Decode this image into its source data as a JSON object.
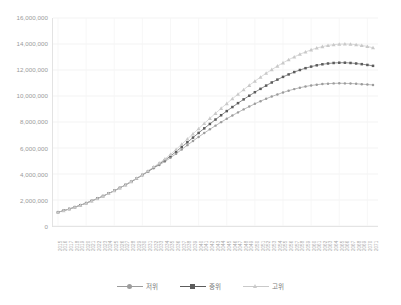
{
  "chart_data": {
    "type": "line",
    "title": "",
    "subtitle": "",
    "xlabel": "",
    "ylabel": "",
    "grid": true,
    "legend_position": "bottom",
    "ylim": [
      0,
      16000000
    ],
    "y_ticks": [
      0,
      2000000,
      4000000,
      6000000,
      8000000,
      10000000,
      12000000,
      14000000,
      16000000
    ],
    "y_tick_labels": [
      "0",
      "2,000,000",
      "4,000,000",
      "6,000,000",
      "8,000,000",
      "10,000,000",
      "12,000,000",
      "14,000,000",
      "16,000,000"
    ],
    "categories": [
      "2015",
      "2016",
      "2017",
      "2018",
      "2019",
      "2020",
      "2021",
      "2022",
      "2023",
      "2024",
      "2025",
      "2026",
      "2027",
      "2028",
      "2029",
      "2030",
      "2031",
      "2032",
      "2033",
      "2034",
      "2035",
      "2036",
      "2037",
      "2038",
      "2039",
      "2040",
      "2041",
      "2042",
      "2043",
      "2044",
      "2045",
      "2046",
      "2047",
      "2048",
      "2049",
      "2050",
      "2051",
      "2052",
      "2053",
      "2054",
      "2055",
      "2056",
      "2057",
      "2058",
      "2059",
      "2060",
      "2061",
      "2062",
      "2063",
      "2064",
      "2065",
      "2066",
      "2067",
      "2068",
      "2069",
      "2070",
      "2071"
    ],
    "series": [
      {
        "name": "저위",
        "color": "#9c9c9c",
        "marker": "circle",
        "values": [
          1060000,
          1180000,
          1310000,
          1450000,
          1600000,
          1760000,
          1930000,
          2110000,
          2300000,
          2500000,
          2710000,
          2930000,
          3160000,
          3400000,
          3650000,
          3910000,
          4180000,
          4450000,
          4700000,
          4960000,
          5250000,
          5560000,
          5890000,
          6220000,
          6540000,
          6850000,
          7150000,
          7440000,
          7720000,
          7990000,
          8250000,
          8500000,
          8740000,
          8970000,
          9190000,
          9400000,
          9600000,
          9790000,
          9960000,
          10120000,
          10270000,
          10410000,
          10530000,
          10640000,
          10730000,
          10810000,
          10870000,
          10920000,
          10950000,
          10970000,
          10980000,
          10970000,
          10960000,
          10940000,
          10910000,
          10880000,
          10850000
        ]
      },
      {
        "name": "중위",
        "color": "#5c5c5c",
        "marker": "square",
        "values": [
          1060000,
          1180000,
          1310000,
          1450000,
          1600000,
          1760000,
          1930000,
          2110000,
          2300000,
          2500000,
          2710000,
          2930000,
          3160000,
          3400000,
          3660000,
          3930000,
          4210000,
          4490000,
          4770000,
          5060000,
          5380000,
          5720000,
          6080000,
          6440000,
          6800000,
          7160000,
          7510000,
          7850000,
          8190000,
          8520000,
          8840000,
          9150000,
          9450000,
          9740000,
          10020000,
          10290000,
          10550000,
          10800000,
          11040000,
          11260000,
          11470000,
          11660000,
          11840000,
          12000000,
          12140000,
          12260000,
          12360000,
          12440000,
          12500000,
          12540000,
          12560000,
          12560000,
          12540000,
          12500000,
          12450000,
          12390000,
          12320000
        ]
      },
      {
        "name": "고위",
        "color": "#c9c9c9",
        "marker": "triangle",
        "values": [
          1060000,
          1180000,
          1310000,
          1450000,
          1600000,
          1760000,
          1930000,
          2110000,
          2300000,
          2500000,
          2710000,
          2930000,
          3170000,
          3420000,
          3680000,
          3950000,
          4240000,
          4540000,
          4840000,
          5160000,
          5510000,
          5890000,
          6290000,
          6690000,
          7090000,
          7490000,
          7890000,
          8280000,
          8670000,
          9050000,
          9420000,
          9790000,
          10140000,
          10490000,
          10820000,
          11140000,
          11450000,
          11750000,
          12030000,
          12300000,
          12550000,
          12790000,
          13010000,
          13210000,
          13390000,
          13550000,
          13690000,
          13800000,
          13890000,
          13950000,
          13990000,
          14000000,
          13990000,
          13950000,
          13890000,
          13810000,
          13710000
        ]
      }
    ]
  },
  "legend": {
    "items": [
      {
        "label": "저위"
      },
      {
        "label": "중위"
      },
      {
        "label": "고위"
      }
    ]
  },
  "colors": {
    "low": "#9c9c9c",
    "mid": "#5c5c5c",
    "high": "#c9c9c9",
    "grid": "#f0f0f0",
    "axis": "#dcdcdc",
    "text": "#9a9a9a"
  }
}
